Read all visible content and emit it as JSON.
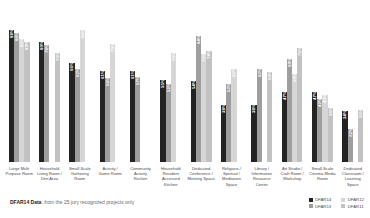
{
  "chart_data": {
    "type": "bar",
    "title": "",
    "xlabel": "",
    "ylabel": "",
    "ylim": [
      0,
      100
    ],
    "grid": false,
    "legend_position": "bottom-right",
    "categories": [
      "Large Multi\nPurpose Room",
      "Household\nLiving Room /\nDen Area",
      "Small-Scale\nGathering\nRoom",
      "Activity /\nGame Room",
      "Community\nActivity\nKitchen",
      "Household\nResident\nAccessed\nKitchen",
      "Dedicated\nConference /\nMeeting Space",
      "Religious /\nSpiritual /\nMeditation\nSpace",
      "Library /\nInformation\nResource\nCenter",
      "Art Studio /\nCraft Room /\nWorkshop",
      "Small-Scale\nCinema Media\nRoom",
      "Dedicated\nClassroom /\nLearning Space"
    ],
    "series": [
      {
        "name": "DFAR14",
        "color": "#232323",
        "values": [
          88,
          80,
          66,
          61,
          61,
          55,
          54,
          38,
          38,
          47,
          47,
          34
        ],
        "labels": [
          "88%",
          "80%",
          "66%",
          "61%",
          "61%",
          "55%",
          "54%",
          "38%",
          "38%",
          "47%",
          "47%",
          "34%"
        ]
      },
      {
        "name": "DFAR13",
        "color": "#9e9e9e",
        "values": [
          86,
          78,
          62,
          56,
          57,
          52,
          84,
          52,
          62,
          69,
          42,
          22
        ],
        "labels": [
          "86%",
          "78%",
          "62%",
          "56%",
          "57%",
          "52%",
          "84%",
          "52%",
          "62%",
          "69%",
          "42%",
          "22%"
        ]
      },
      {
        "name": "DFAR12",
        "color": "#d6d6d6",
        "values": [
          82,
          0,
          88,
          79,
          0,
          73,
          72,
          62,
          0,
          59,
          45,
          0
        ],
        "labels": [
          "82%",
          "",
          "88%",
          "79%",
          "",
          "73%",
          "72%",
          "62%",
          "",
          "59%",
          "45%",
          ""
        ]
      },
      {
        "name": "DFAR11",
        "color": "#c2c2c2",
        "values": [
          80,
          73,
          0,
          0,
          0,
          0,
          74,
          0,
          60,
          76,
          36,
          35
        ],
        "labels": [
          "80%",
          "73%",
          "",
          "",
          "",
          "",
          "74%",
          "",
          "60%",
          "76%",
          "36%",
          "35%"
        ]
      }
    ]
  },
  "footnote": {
    "emphasis": "DFAR14 Data",
    "text": ": from the 25 jury recognized projects only"
  },
  "legend": {
    "items": [
      {
        "label": "DFAR14",
        "color": "#232323"
      },
      {
        "label": "DFAR12",
        "color": "#d6d6d6"
      },
      {
        "label": "DFAR13",
        "color": "#9e9e9e"
      },
      {
        "label": "DFAR11",
        "color": "#c2c2c2"
      }
    ]
  }
}
